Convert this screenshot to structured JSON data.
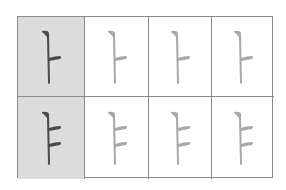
{
  "grid": {
    "rows": [
      {
        "label": "ㅏ",
        "cells": [
          {
            "glyph": "ㅏ",
            "highlighted": true,
            "stroke_color": "#4a4a4a"
          },
          {
            "glyph": "ㅏ",
            "highlighted": false,
            "stroke_color": "#a8a8a8"
          },
          {
            "glyph": "ㅏ",
            "highlighted": false,
            "stroke_color": "#a8a8a8"
          },
          {
            "glyph": "ㅏ",
            "highlighted": false,
            "stroke_color": "#a8a8a8"
          }
        ]
      },
      {
        "label": "ㅑ",
        "cells": [
          {
            "glyph": "ㅑ",
            "highlighted": true,
            "stroke_color": "#4a4a4a"
          },
          {
            "glyph": "ㅑ",
            "highlighted": false,
            "stroke_color": "#a8a8a8"
          },
          {
            "glyph": "ㅑ",
            "highlighted": false,
            "stroke_color": "#a8a8a8"
          },
          {
            "glyph": "ㅑ",
            "highlighted": false,
            "stroke_color": "#a8a8a8"
          }
        ]
      }
    ],
    "colors": {
      "line": "#8a8a8a",
      "highlight_bg": "#dcdcdc",
      "background": "#ffffff"
    }
  }
}
